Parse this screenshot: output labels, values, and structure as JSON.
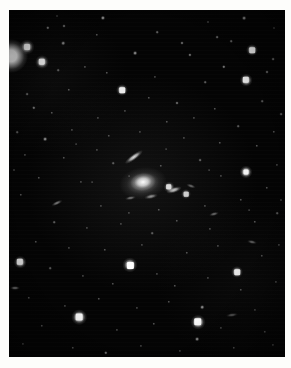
{
  "image": {
    "type": "astronomical-photograph",
    "subject": "galaxy cluster star field",
    "caption": "",
    "canvas": {
      "width": 291,
      "height": 368
    },
    "frame": {
      "left": 9,
      "top": 10,
      "width": 276,
      "height": 347
    },
    "colors": {
      "page_background": "#fdfdfb",
      "sky_background": "#040404",
      "source_color": "#ffffff"
    }
  },
  "chart_data": {
    "type": "scatter",
    "title": "",
    "xlabel": "",
    "ylabel": "",
    "grid": false,
    "legend": "none",
    "xlim": [
      0,
      276
    ],
    "ylim": [
      0,
      347
    ],
    "note": "Point sources (stars/galaxies) on a photographic plate. x,y are pixel offsets inside the sky frame; r is the apparent radius in px; b is relative brightness 0-1.",
    "edge_blob": {
      "x": 2,
      "y": 46,
      "r": 17,
      "b": 1.0
    },
    "galaxies": [
      {
        "name": "central-brightest-cluster-galaxy",
        "x": 134,
        "y": 172,
        "rx": 13,
        "ry": 9,
        "angle": -8,
        "b": 1.0
      },
      {
        "name": "central-galaxy-halo",
        "x": 134,
        "y": 173,
        "rx": 24,
        "ry": 16,
        "angle": -8,
        "b": 0.35
      },
      {
        "name": "edge-on-streak-upper",
        "x": 125,
        "y": 147,
        "rx": 11,
        "ry": 3.2,
        "angle": -36,
        "b": 0.88
      },
      {
        "name": "streak-east-of-core",
        "x": 165,
        "y": 180,
        "rx": 8,
        "ry": 3.0,
        "angle": -18,
        "b": 0.8
      },
      {
        "name": "streak-below-core",
        "x": 142,
        "y": 186,
        "rx": 7,
        "ry": 2.4,
        "angle": -12,
        "b": 0.55
      },
      {
        "name": "streak-lower-left",
        "x": 121,
        "y": 188,
        "rx": 5.5,
        "ry": 2.2,
        "angle": -10,
        "b": 0.45
      },
      {
        "name": "streak-right-upper",
        "x": 182,
        "y": 176,
        "rx": 5,
        "ry": 2.0,
        "angle": 20,
        "b": 0.4
      },
      {
        "name": "streak-midleft",
        "x": 48,
        "y": 193,
        "rx": 6,
        "ry": 2.2,
        "angle": -25,
        "b": 0.48
      },
      {
        "name": "streak-lower-right",
        "x": 205,
        "y": 204,
        "rx": 5,
        "ry": 2.0,
        "angle": -15,
        "b": 0.42
      },
      {
        "name": "streak-far-right",
        "x": 243,
        "y": 232,
        "rx": 5,
        "ry": 2.0,
        "angle": 12,
        "b": 0.38
      },
      {
        "name": "streak-left-edge",
        "x": 6,
        "y": 278,
        "rx": 5,
        "ry": 2.2,
        "angle": 0,
        "b": 0.5
      },
      {
        "name": "streak-bottom-right",
        "x": 223,
        "y": 305,
        "rx": 6,
        "ry": 2.2,
        "angle": -8,
        "b": 0.35
      }
    ],
    "bright_stars": [
      {
        "x": 18,
        "y": 37,
        "r": 7.5,
        "b": 1.0
      },
      {
        "x": 33,
        "y": 52,
        "r": 7.0,
        "b": 0.98
      },
      {
        "x": 243,
        "y": 40,
        "r": 6.0,
        "b": 0.95
      },
      {
        "x": 113,
        "y": 80,
        "r": 6.0,
        "b": 0.92
      },
      {
        "x": 237,
        "y": 70,
        "r": 6.3,
        "b": 0.94
      },
      {
        "x": 237,
        "y": 162,
        "r": 6.5,
        "b": 0.95
      },
      {
        "x": 11,
        "y": 252,
        "r": 6.3,
        "b": 0.93
      },
      {
        "x": 121,
        "y": 255,
        "r": 7.6,
        "b": 1.0
      },
      {
        "x": 70,
        "y": 307,
        "r": 7.8,
        "b": 1.0
      },
      {
        "x": 189,
        "y": 312,
        "r": 7.4,
        "b": 1.0
      },
      {
        "x": 228,
        "y": 262,
        "r": 6.0,
        "b": 0.9
      },
      {
        "x": 177,
        "y": 184,
        "r": 5.0,
        "b": 0.8
      },
      {
        "x": 160,
        "y": 177,
        "r": 5.4,
        "b": 0.85
      }
    ],
    "faint_stars": [
      {
        "x": 94,
        "y": 8,
        "r": 2.6,
        "b": 0.6
      },
      {
        "x": 235,
        "y": 8,
        "r": 2.4,
        "b": 0.55
      },
      {
        "x": 39,
        "y": 18,
        "r": 2.2,
        "b": 0.5
      },
      {
        "x": 55,
        "y": 16,
        "r": 2.0,
        "b": 0.45
      },
      {
        "x": 148,
        "y": 22,
        "r": 1.8,
        "b": 0.4
      },
      {
        "x": 173,
        "y": 33,
        "r": 2.0,
        "b": 0.42
      },
      {
        "x": 208,
        "y": 27,
        "r": 1.9,
        "b": 0.4
      },
      {
        "x": 54,
        "y": 33,
        "r": 2.3,
        "b": 0.52
      },
      {
        "x": 88,
        "y": 25,
        "r": 1.7,
        "b": 0.35
      },
      {
        "x": 126,
        "y": 43,
        "r": 2.4,
        "b": 0.52
      },
      {
        "x": 181,
        "y": 45,
        "r": 2.1,
        "b": 0.44
      },
      {
        "x": 222,
        "y": 31,
        "r": 1.8,
        "b": 0.38
      },
      {
        "x": 264,
        "y": 49,
        "r": 1.9,
        "b": 0.4
      },
      {
        "x": 215,
        "y": 57,
        "r": 2.2,
        "b": 0.48
      },
      {
        "x": 258,
        "y": 62,
        "r": 2.0,
        "b": 0.42
      },
      {
        "x": 49,
        "y": 60,
        "r": 1.8,
        "b": 0.36
      },
      {
        "x": 76,
        "y": 57,
        "r": 1.6,
        "b": 0.32
      },
      {
        "x": 98,
        "y": 63,
        "r": 1.7,
        "b": 0.34
      },
      {
        "x": 146,
        "y": 67,
        "r": 1.6,
        "b": 0.3
      },
      {
        "x": 196,
        "y": 72,
        "r": 1.8,
        "b": 0.36
      },
      {
        "x": 18,
        "y": 84,
        "r": 1.9,
        "b": 0.38
      },
      {
        "x": 60,
        "y": 80,
        "r": 1.7,
        "b": 0.34
      },
      {
        "x": 140,
        "y": 88,
        "r": 1.7,
        "b": 0.33
      },
      {
        "x": 168,
        "y": 93,
        "r": 2.0,
        "b": 0.42
      },
      {
        "x": 206,
        "y": 99,
        "r": 1.7,
        "b": 0.33
      },
      {
        "x": 253,
        "y": 91,
        "r": 1.8,
        "b": 0.36
      },
      {
        "x": 272,
        "y": 104,
        "r": 1.9,
        "b": 0.38
      },
      {
        "x": 25,
        "y": 98,
        "r": 2.2,
        "b": 0.46
      },
      {
        "x": 43,
        "y": 103,
        "r": 1.7,
        "b": 0.33
      },
      {
        "x": 89,
        "y": 108,
        "r": 1.6,
        "b": 0.3
      },
      {
        "x": 116,
        "y": 101,
        "r": 1.6,
        "b": 0.3
      },
      {
        "x": 158,
        "y": 112,
        "r": 1.7,
        "b": 0.33
      },
      {
        "x": 185,
        "y": 108,
        "r": 1.6,
        "b": 0.31
      },
      {
        "x": 229,
        "y": 116,
        "r": 1.8,
        "b": 0.35
      },
      {
        "x": 265,
        "y": 122,
        "r": 1.7,
        "b": 0.33
      },
      {
        "x": 8,
        "y": 122,
        "r": 1.8,
        "b": 0.35
      },
      {
        "x": 36,
        "y": 129,
        "r": 2.4,
        "b": 0.52
      },
      {
        "x": 63,
        "y": 120,
        "r": 1.6,
        "b": 0.3
      },
      {
        "x": 100,
        "y": 126,
        "r": 1.7,
        "b": 0.32
      },
      {
        "x": 131,
        "y": 122,
        "r": 1.6,
        "b": 0.3
      },
      {
        "x": 175,
        "y": 128,
        "r": 1.6,
        "b": 0.31
      },
      {
        "x": 211,
        "y": 133,
        "r": 1.7,
        "b": 0.33
      },
      {
        "x": 248,
        "y": 136,
        "r": 1.7,
        "b": 0.34
      },
      {
        "x": 16,
        "y": 145,
        "r": 1.6,
        "b": 0.3
      },
      {
        "x": 55,
        "y": 148,
        "r": 1.7,
        "b": 0.32
      },
      {
        "x": 88,
        "y": 140,
        "r": 1.6,
        "b": 0.3
      },
      {
        "x": 104,
        "y": 153,
        "r": 1.8,
        "b": 0.35
      },
      {
        "x": 152,
        "y": 156,
        "r": 1.7,
        "b": 0.33
      },
      {
        "x": 191,
        "y": 150,
        "r": 1.9,
        "b": 0.38
      },
      {
        "x": 268,
        "y": 155,
        "r": 1.6,
        "b": 0.3
      },
      {
        "x": 30,
        "y": 168,
        "r": 1.7,
        "b": 0.32
      },
      {
        "x": 72,
        "y": 172,
        "r": 1.6,
        "b": 0.3
      },
      {
        "x": 212,
        "y": 166,
        "r": 1.6,
        "b": 0.31
      },
      {
        "x": 258,
        "y": 178,
        "r": 1.7,
        "b": 0.33
      },
      {
        "x": 12,
        "y": 185,
        "r": 1.7,
        "b": 0.32
      },
      {
        "x": 92,
        "y": 196,
        "r": 1.6,
        "b": 0.3
      },
      {
        "x": 120,
        "y": 203,
        "r": 1.6,
        "b": 0.3
      },
      {
        "x": 150,
        "y": 200,
        "r": 1.7,
        "b": 0.33
      },
      {
        "x": 196,
        "y": 196,
        "r": 1.6,
        "b": 0.31
      },
      {
        "x": 232,
        "y": 190,
        "r": 1.7,
        "b": 0.33
      },
      {
        "x": 45,
        "y": 212,
        "r": 1.8,
        "b": 0.35
      },
      {
        "x": 78,
        "y": 218,
        "r": 1.6,
        "b": 0.3
      },
      {
        "x": 112,
        "y": 214,
        "r": 1.6,
        "b": 0.3
      },
      {
        "x": 143,
        "y": 223,
        "r": 1.8,
        "b": 0.36
      },
      {
        "x": 168,
        "y": 211,
        "r": 1.7,
        "b": 0.33
      },
      {
        "x": 201,
        "y": 219,
        "r": 1.6,
        "b": 0.31
      },
      {
        "x": 246,
        "y": 212,
        "r": 1.7,
        "b": 0.33
      },
      {
        "x": 268,
        "y": 203,
        "r": 1.8,
        "b": 0.36
      },
      {
        "x": 27,
        "y": 232,
        "r": 1.7,
        "b": 0.32
      },
      {
        "x": 60,
        "y": 238,
        "r": 1.6,
        "b": 0.3
      },
      {
        "x": 96,
        "y": 240,
        "r": 1.7,
        "b": 0.33
      },
      {
        "x": 133,
        "y": 235,
        "r": 1.6,
        "b": 0.3
      },
      {
        "x": 178,
        "y": 243,
        "r": 1.7,
        "b": 0.33
      },
      {
        "x": 209,
        "y": 236,
        "r": 1.6,
        "b": 0.31
      },
      {
        "x": 253,
        "y": 246,
        "r": 1.7,
        "b": 0.32
      },
      {
        "x": 270,
        "y": 235,
        "r": 1.6,
        "b": 0.3
      },
      {
        "x": 41,
        "y": 258,
        "r": 1.8,
        "b": 0.35
      },
      {
        "x": 74,
        "y": 266,
        "r": 1.6,
        "b": 0.3
      },
      {
        "x": 104,
        "y": 274,
        "r": 1.7,
        "b": 0.32
      },
      {
        "x": 148,
        "y": 264,
        "r": 1.6,
        "b": 0.3
      },
      {
        "x": 166,
        "y": 276,
        "r": 1.7,
        "b": 0.33
      },
      {
        "x": 199,
        "y": 268,
        "r": 1.6,
        "b": 0.3
      },
      {
        "x": 232,
        "y": 280,
        "r": 1.7,
        "b": 0.32
      },
      {
        "x": 267,
        "y": 272,
        "r": 1.6,
        "b": 0.31
      },
      {
        "x": 20,
        "y": 288,
        "r": 1.7,
        "b": 0.32
      },
      {
        "x": 56,
        "y": 296,
        "r": 1.6,
        "b": 0.3
      },
      {
        "x": 90,
        "y": 289,
        "r": 1.7,
        "b": 0.33
      },
      {
        "x": 128,
        "y": 298,
        "r": 1.6,
        "b": 0.3
      },
      {
        "x": 160,
        "y": 292,
        "r": 1.7,
        "b": 0.32
      },
      {
        "x": 193,
        "y": 297,
        "r": 2.3,
        "b": 0.52
      },
      {
        "x": 246,
        "y": 300,
        "r": 1.6,
        "b": 0.3
      },
      {
        "x": 188,
        "y": 329,
        "r": 2.4,
        "b": 0.55
      },
      {
        "x": 33,
        "y": 316,
        "r": 1.7,
        "b": 0.32
      },
      {
        "x": 108,
        "y": 320,
        "r": 1.6,
        "b": 0.3
      },
      {
        "x": 145,
        "y": 314,
        "r": 1.7,
        "b": 0.33
      },
      {
        "x": 212,
        "y": 318,
        "r": 1.6,
        "b": 0.3
      },
      {
        "x": 256,
        "y": 322,
        "r": 1.7,
        "b": 0.32
      },
      {
        "x": 14,
        "y": 334,
        "r": 1.6,
        "b": 0.3
      },
      {
        "x": 64,
        "y": 338,
        "r": 1.7,
        "b": 0.33
      },
      {
        "x": 97,
        "y": 343,
        "r": 2.2,
        "b": 0.5
      },
      {
        "x": 132,
        "y": 336,
        "r": 1.6,
        "b": 0.3
      },
      {
        "x": 171,
        "y": 341,
        "r": 1.6,
        "b": 0.3
      },
      {
        "x": 225,
        "y": 338,
        "r": 1.7,
        "b": 0.32
      },
      {
        "x": 264,
        "y": 335,
        "r": 1.6,
        "b": 0.31
      },
      {
        "x": 48,
        "y": 6,
        "r": 1.5,
        "b": 0.28
      },
      {
        "x": 199,
        "y": 12,
        "r": 1.5,
        "b": 0.28
      },
      {
        "x": 265,
        "y": 18,
        "r": 1.5,
        "b": 0.28
      },
      {
        "x": 5,
        "y": 160,
        "r": 1.5,
        "b": 0.28
      },
      {
        "x": 272,
        "y": 190,
        "r": 1.5,
        "b": 0.28
      },
      {
        "x": 83,
        "y": 172,
        "r": 1.4,
        "b": 0.26
      },
      {
        "x": 67,
        "y": 134,
        "r": 1.4,
        "b": 0.26
      },
      {
        "x": 120,
        "y": 166,
        "r": 1.4,
        "b": 0.26
      },
      {
        "x": 157,
        "y": 139,
        "r": 1.4,
        "b": 0.26
      },
      {
        "x": 200,
        "y": 160,
        "r": 1.4,
        "b": 0.26
      },
      {
        "x": 240,
        "y": 200,
        "r": 1.4,
        "b": 0.26
      }
    ]
  }
}
